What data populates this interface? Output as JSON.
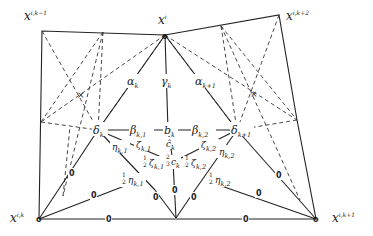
{
  "diagram": {
    "type": "triangulated patch / finite element macro-structure",
    "vertices": {
      "x_i_k_minus_1": {
        "base": "x",
        "sup": "i,k−1"
      },
      "x_i": {
        "base": "x",
        "sup": "i"
      },
      "x_i_k_plus_2": {
        "base": "x",
        "sup": "i,k+2"
      },
      "x_i_k": {
        "base": "x",
        "sup": "i,k"
      },
      "x_i_k_plus_1": {
        "base": "x",
        "sup": "i,k+1"
      }
    },
    "labels": {
      "alpha_k": {
        "base": "α",
        "sub": "k"
      },
      "gamma_k": {
        "base": "γ",
        "sub": "k"
      },
      "alpha_k1": {
        "base": "α",
        "sub": "k+1"
      },
      "delta_k": {
        "base": "δ",
        "sub": "k"
      },
      "beta_k1": {
        "base": "β",
        "sub": "k,1"
      },
      "b_k": {
        "base": "b",
        "sub": "k"
      },
      "beta_k2": {
        "base": "β",
        "sub": "k,2"
      },
      "delta_k1": {
        "base": "δ",
        "sub": "k+1"
      },
      "eta_k1": {
        "base": "η",
        "sub": "k,1"
      },
      "zeta_k1": {
        "base": "ζ",
        "sub": "k,1"
      },
      "c_hat_k": {
        "base": "ĉ",
        "sub": "k"
      },
      "zeta_k2": {
        "base": "ζ",
        "sub": "k,2"
      },
      "eta_k2": {
        "base": "η",
        "sub": "k,2"
      },
      "half_zeta_k1": {
        "coef": "1/2",
        "base": "ζ",
        "sub": "k,1"
      },
      "two_thirds_c_k": {
        "coef": "2/3",
        "base": "c",
        "sub": "k"
      },
      "half_zeta_k2": {
        "coef": "1/2",
        "base": "ζ",
        "sub": "k,2"
      },
      "half_eta_k1": {
        "coef": "1/2",
        "base": "η",
        "sub": "k,1"
      },
      "half_eta_k2": {
        "coef": "1/2",
        "base": "η",
        "sub": "k,2"
      }
    },
    "zero_value": "0",
    "vertex_marker": "o",
    "colors": {
      "stroke": "#222222",
      "background": "#ffffff"
    }
  }
}
